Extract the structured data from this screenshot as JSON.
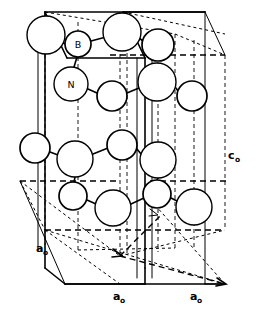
{
  "figure": {
    "type": "crystal-structure-diagram",
    "background_color": "#ffffff",
    "line_color": "#000000",
    "atom_fill_color": "#ffffff"
  },
  "atom_labels": [
    {
      "id": "B",
      "text": "B",
      "x": 78,
      "y": 44,
      "r": 13
    },
    {
      "id": "N",
      "text": "N",
      "x": 71,
      "y": 84,
      "r": 17
    }
  ],
  "axis_labels": [
    {
      "id": "a0-left",
      "base": "a",
      "sub": "o",
      "x": 36,
      "y": 252
    },
    {
      "id": "a0-bottom",
      "base": "a",
      "sub": "o",
      "x": 113,
      "y": 300
    },
    {
      "id": "a0-right",
      "base": "a",
      "sub": "o",
      "x": 190,
      "y": 300
    },
    {
      "id": "c0-right",
      "base": "c",
      "sub": "o",
      "x": 228,
      "y": 159
    }
  ],
  "legend": {
    "boron": "B",
    "nitrogen": "N",
    "lattice_a": "a",
    "lattice_c": "c",
    "subscript": "o"
  },
  "atoms": [
    {
      "id": "a1",
      "cx": 46,
      "cy": 35,
      "r": 19,
      "weight": "thin"
    },
    {
      "id": "a2",
      "cx": 78,
      "cy": 44,
      "r": 13,
      "weight": "bold"
    },
    {
      "id": "a3",
      "cx": 122,
      "cy": 32,
      "r": 19,
      "weight": "thin"
    },
    {
      "id": "a4",
      "cx": 158,
      "cy": 45,
      "r": 16,
      "weight": "bold"
    },
    {
      "id": "a5",
      "cx": 71,
      "cy": 84,
      "r": 17,
      "weight": "thin"
    },
    {
      "id": "a6",
      "cx": 112,
      "cy": 96,
      "r": 15,
      "weight": "bold"
    },
    {
      "id": "a7",
      "cx": 157,
      "cy": 82,
      "r": 19,
      "weight": "thin"
    },
    {
      "id": "a8",
      "cx": 192,
      "cy": 96,
      "r": 15,
      "weight": "bold"
    },
    {
      "id": "a9",
      "cx": 35,
      "cy": 148,
      "r": 15,
      "weight": "bold"
    },
    {
      "id": "a10",
      "cx": 75,
      "cy": 159,
      "r": 18,
      "weight": "thin"
    },
    {
      "id": "a11",
      "cx": 122,
      "cy": 145,
      "r": 15,
      "weight": "bold"
    },
    {
      "id": "a12",
      "cx": 158,
      "cy": 160,
      "r": 18,
      "weight": "thin"
    },
    {
      "id": "a13",
      "cx": 73,
      "cy": 196,
      "r": 14,
      "weight": "bold"
    },
    {
      "id": "a14",
      "cx": 113,
      "cy": 208,
      "r": 18,
      "weight": "thin"
    },
    {
      "id": "a15",
      "cx": 157,
      "cy": 194,
      "r": 14,
      "weight": "bold"
    },
    {
      "id": "a16",
      "cx": 194,
      "cy": 207,
      "r": 18,
      "weight": "thin"
    }
  ]
}
